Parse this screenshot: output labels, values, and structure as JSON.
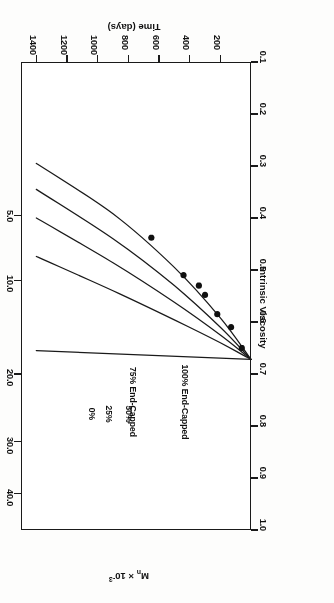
{
  "figure": {
    "background_color": "#ffffff",
    "ink_color": "#1a1a1a",
    "orientation_note": "printed sideways (rotated 180 degrees)"
  },
  "chart_data": {
    "type": "line",
    "title": "",
    "xlabel": "Time (days)",
    "ylabel": "Intrinsic Viscosity",
    "secondary_axis_label": "Mn x 10-3",
    "secondary_axis_label_parts": {
      "symbol": "M",
      "subscript": "n",
      "times": " × ",
      "base": "10",
      "exponent": "-3"
    },
    "xlim": [
      0,
      1500
    ],
    "ylim": [
      0.1,
      1.0
    ],
    "grid": false,
    "legend_position": "inline-curve-labels",
    "xticks": [
      200,
      400,
      600,
      800,
      1000,
      1200,
      1400
    ],
    "xticklabels": [
      "200",
      "400",
      "600",
      "800",
      "1000",
      "1200",
      "1400"
    ],
    "yticks": [
      0.1,
      0.2,
      0.3,
      0.4,
      0.5,
      0.6,
      0.7,
      0.8,
      0.9,
      1.0
    ],
    "yticklabels": [
      "0.1",
      "0.2",
      "0.3",
      "0.4",
      "0.5",
      "0.6",
      "0.7",
      "0.8",
      "0.9",
      "1.0"
    ],
    "secondary_ticks_iv": [
      0.93,
      0.83,
      0.7,
      0.52,
      0.395
    ],
    "secondary_ticklabels": [
      "40.0",
      "30.0",
      "20.0",
      "10.0",
      "5.0"
    ],
    "series": [
      {
        "name": "100% End-Capped",
        "label": "100%  End-Capped",
        "points": [
          [
            0,
            0.672
          ],
          [
            1400,
            0.655
          ]
        ]
      },
      {
        "name": "75% End-Capped",
        "label": "75% End-Capped",
        "points": [
          [
            0,
            0.672
          ],
          [
            200,
            0.64
          ],
          [
            500,
            0.596
          ],
          [
            900,
            0.54
          ],
          [
            1400,
            0.474
          ]
        ]
      },
      {
        "name": "50%",
        "label": "50%",
        "points": [
          [
            0,
            0.672
          ],
          [
            200,
            0.625
          ],
          [
            500,
            0.562
          ],
          [
            900,
            0.486
          ],
          [
            1400,
            0.4
          ]
        ]
      },
      {
        "name": "25%",
        "label": "25%",
        "points": [
          [
            0,
            0.672
          ],
          [
            200,
            0.61
          ],
          [
            500,
            0.53
          ],
          [
            900,
            0.44
          ],
          [
            1400,
            0.345
          ]
        ]
      },
      {
        "name": "0%",
        "label": "0%",
        "points": [
          [
            0,
            0.672
          ],
          [
            200,
            0.592
          ],
          [
            500,
            0.495
          ],
          [
            900,
            0.392
          ],
          [
            1400,
            0.295
          ]
        ]
      }
    ],
    "data_points": {
      "name": "measured data",
      "marker": "filled-circle",
      "values": [
        [
          60,
          0.65
        ],
        [
          130,
          0.61
        ],
        [
          220,
          0.585
        ],
        [
          300,
          0.548
        ],
        [
          340,
          0.53
        ],
        [
          440,
          0.51
        ],
        [
          650,
          0.438
        ]
      ]
    }
  }
}
